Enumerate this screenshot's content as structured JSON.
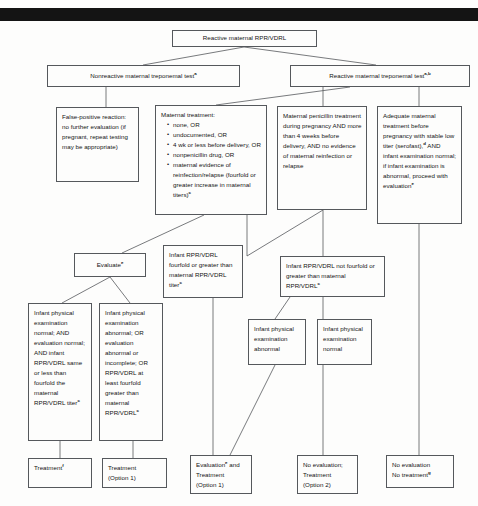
{
  "page": {
    "scan_artifact": "black-scan-bar"
  },
  "nodes": {
    "root": {
      "text": "Reactive maternal RPR/VDRL"
    },
    "nonreactive_treponemal": {
      "text": "Nonreactive maternal treponemal test",
      "sup": "a"
    },
    "reactive_treponemal": {
      "text": "Reactive maternal treponemal test",
      "sup": "a,b"
    },
    "false_positive": {
      "text": "False-positive reaction: no further evaluation (if pregnant, repeat testing may be appropriate)"
    },
    "maternal_treatment": {
      "lead": "Maternal treatment:",
      "items": [
        "none, OR",
        "undocumented, OR",
        "4 wk or less before delivery, OR",
        "nonpenicillin drug, OR",
        "maternal evidence of reinfection/relapse (fourfold or greater increase in maternal titers)"
      ],
      "last_sup": "c"
    },
    "maternal_penicillin": {
      "text": "Maternal penicillin treatment during pregnancy AND more than 4 weeks before delivery, AND no evidence of maternal reinfection or relapse"
    },
    "adequate_treatment": {
      "part1": "Adequate maternal treatment before pregnancy with stable low titer (serofast),",
      "sup1": "d",
      "part2": " AND infant examination normal; if infant examination is abnormal, proceed with evaluation",
      "sup2": "e"
    },
    "evaluate": {
      "text": "Evaluate",
      "sup": "e"
    },
    "infant_fourfold": {
      "text": "Infant RPR/VDRL fourfold or greater than maternal RPR/VDRL titer",
      "sup": "c"
    },
    "infant_not_fourfold": {
      "text": "Infant RPR/VDRL not fourfold or greater than maternal RPR/VDRL",
      "sup": "c"
    },
    "exam_normal_all": {
      "text": "Infant physical examination normal; AND evaluation normal; AND infant RPR/VDRL same or less than fourfold the maternal RPR/VDRL titer",
      "sup": "c"
    },
    "exam_abnormal_all": {
      "text": "Infant physical examination abnormal; OR evaluation abnormal or incomplete; OR RPR/VDRL at least fourfold greater than maternal RPR/VDRL",
      "sup": "c"
    },
    "infant_exam_abnormal": {
      "text": "Infant physical examination abnormal"
    },
    "infant_exam_normal": {
      "text": "Infant physical examination normal"
    },
    "treatment_f": {
      "text": "Treatment",
      "sup": "f"
    },
    "treatment_option1": {
      "line1": "Treatment",
      "line2": "(Option 1)"
    },
    "evaluation_treatment_option1": {
      "line1": "Evaluation",
      "sup": "e",
      "line1_tail": " and",
      "line2": "Treatment",
      "line3": "(Option 1)"
    },
    "no_eval_treatment_option2": {
      "line1": "No evaluation;",
      "line2": "Treatment",
      "line3": "(Option 2)"
    },
    "no_eval_no_treatment": {
      "line1": "No evaluation",
      "line2": "No treatment",
      "sup": "g"
    }
  },
  "colors": {
    "box_border": "#55585c",
    "connector": "#55585c",
    "text": "#141414",
    "background": "#fdfdfc",
    "scan_bar": "#141414"
  }
}
